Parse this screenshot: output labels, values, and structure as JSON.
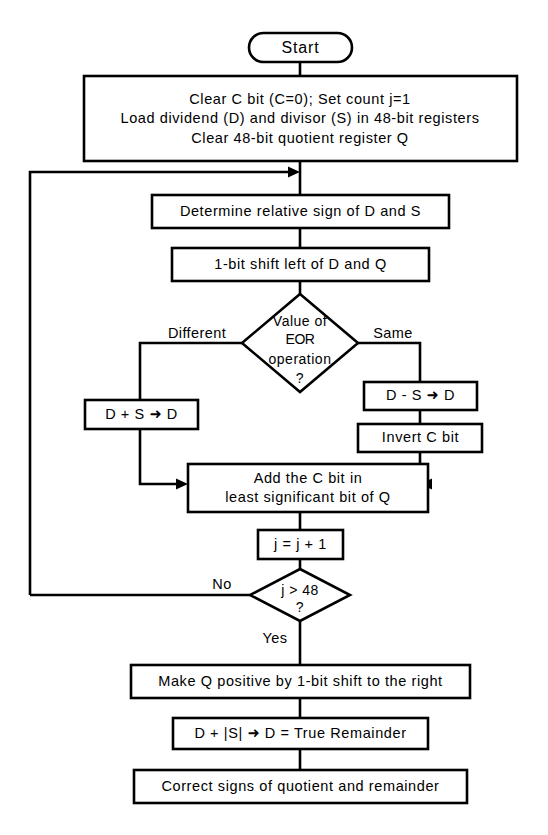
{
  "diagram": {
    "stroke_color": "#000000",
    "fill_color": "#ffffff",
    "background": "#ffffff"
  },
  "nodes": {
    "start": {
      "label": "Start",
      "type": "terminator"
    },
    "init": {
      "type": "process",
      "line1": "Clear C bit (C=0);  Set count j=1",
      "line2": "Load dividend (D) and divisor (S) in 48-bit registers",
      "line3": "Clear 48-bit quotient register Q"
    },
    "determine_sign": {
      "type": "process",
      "label": "Determine relative sign of D and S"
    },
    "shift_left": {
      "type": "process",
      "label": "1-bit shift left of D and Q"
    },
    "eor_decision": {
      "type": "decision",
      "line1": "Value of",
      "line2": "EOR",
      "line3": "operation",
      "line4": "?",
      "branch_left": "Different",
      "branch_right": "Same"
    },
    "add_ds": {
      "type": "process",
      "label": "D + S ➜ D"
    },
    "sub_ds": {
      "type": "process",
      "label": "D - S ➜ D"
    },
    "invert_c": {
      "type": "process",
      "label": "Invert C bit"
    },
    "add_c_bit": {
      "type": "process",
      "line1": "Add the C bit in",
      "line2": "least significant bit of Q"
    },
    "increment_j": {
      "type": "process",
      "label": "j = j + 1"
    },
    "j_decision": {
      "type": "decision",
      "line1": "j > 48",
      "line2": "?",
      "branch_left": "No",
      "branch_down": "Yes"
    },
    "make_q_positive": {
      "type": "process",
      "label": "Make Q positive by 1-bit shift to the right"
    },
    "true_remainder": {
      "type": "process",
      "label": "D + |S| ➜ D = True Remainder"
    },
    "correct_signs": {
      "type": "process",
      "label": "Correct signs of quotient and remainder"
    }
  }
}
